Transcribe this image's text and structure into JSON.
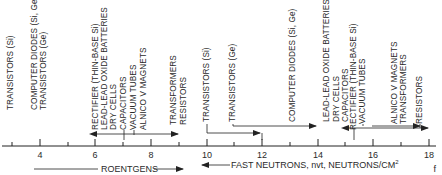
{
  "diagram": {
    "axis": {
      "ticks": [
        "4",
        "6",
        "8",
        "10",
        "12",
        "14",
        "16",
        "18"
      ],
      "roentgens_label": "ROENTGENS",
      "neutrons_label": "FAST NEUTRONS, nvt, NEUTRONS/CM",
      "neutrons_sup": "2"
    },
    "roentgens_labels": [
      "TRANSISTORS (Si)",
      "COMPUTER DIODES (Si, Ge)",
      "TRANSISTORS (Ge)",
      "RECTIFIER (THIN-BASE Si)",
      "LEAD-LEAD OXIDE BATTERIES",
      "DRY CELLS",
      "CAPACITORS",
      "VACUUM TUBES",
      "ALNICO V MAGNETS",
      "TRANSFORMERS",
      "RESISTORS"
    ],
    "neutron_labels": [
      "TRANSISTORS (Si)",
      "TRANSISTORS (Ge)",
      "COMPUTER DIODES (Si, Ge)",
      "LEAD-LEAD OXIDE BATTERIES",
      "DRY CELLS",
      "CAPACITORS",
      "RECTIFIER (THIN-BASE Si)",
      "VACUUM TUBES",
      "ALNICO V MAGNETS",
      "TRANSFORMERS",
      "RESISTORS"
    ],
    "footer_fragment": "f"
  }
}
